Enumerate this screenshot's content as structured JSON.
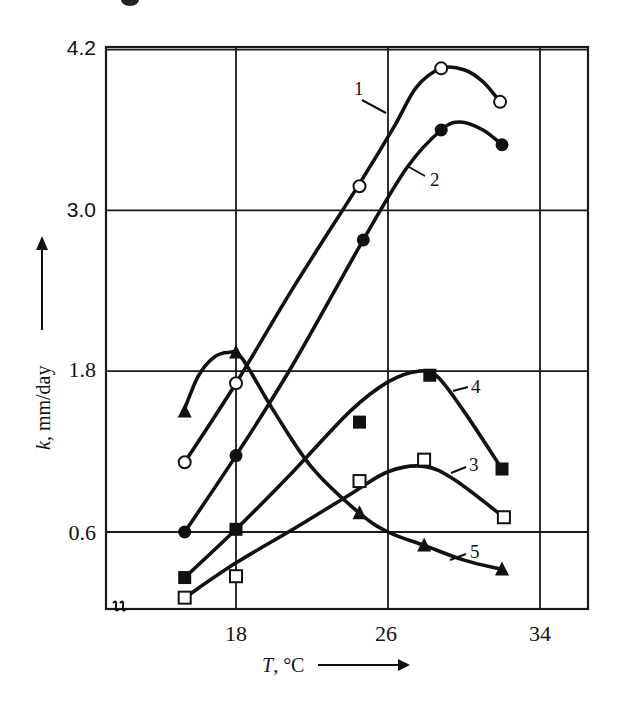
{
  "chart_data": {
    "type": "line",
    "title": "",
    "xlabel": "T, °C",
    "ylabel": "k, mm/day",
    "xlim": [
      11.2,
      36.5
    ],
    "ylim": [
      0.0,
      4.2
    ],
    "grid": true,
    "legend": "inline numeric labels 1-5 with leader lines",
    "x_ticks": [
      18,
      26,
      34
    ],
    "x_tick_labels": [
      "18",
      "26",
      "34"
    ],
    "y_ticks": [
      0.6,
      1.8,
      3.0,
      4.2
    ],
    "y_tick_labels": [
      "0.6",
      "1.8",
      "3.0",
      "4.2"
    ],
    "axis_break_mark": "ff",
    "series": [
      {
        "name": "1",
        "marker": "open-circle",
        "points": [
          {
            "x": 15.3,
            "y": 1.12
          },
          {
            "x": 18.0,
            "y": 1.71
          },
          {
            "x": 24.5,
            "y": 3.18
          },
          {
            "x": 28.8,
            "y": 4.06
          },
          {
            "x": 31.9,
            "y": 3.81
          }
        ],
        "curve": [
          [
            15.3,
            1.12
          ],
          [
            18.0,
            1.71
          ],
          [
            21.0,
            2.42
          ],
          [
            24.5,
            3.2
          ],
          [
            26.3,
            3.62
          ],
          [
            27.5,
            3.92
          ],
          [
            28.8,
            4.06
          ],
          [
            30.0,
            4.05
          ],
          [
            31.0,
            3.96
          ],
          [
            31.9,
            3.81
          ]
        ],
        "label_pos": [
          354,
          95
        ],
        "leader": [
          [
            362,
            100
          ],
          [
            386,
            113
          ]
        ]
      },
      {
        "name": "2",
        "marker": "filled-circle",
        "points": [
          {
            "x": 15.3,
            "y": 0.6
          },
          {
            "x": 18.0,
            "y": 1.17
          },
          {
            "x": 24.7,
            "y": 2.78
          },
          {
            "x": 28.8,
            "y": 3.6
          },
          {
            "x": 32.0,
            "y": 3.49
          }
        ],
        "curve": [
          [
            15.3,
            0.6
          ],
          [
            18.0,
            1.17
          ],
          [
            21.0,
            1.85
          ],
          [
            24.7,
            2.78
          ],
          [
            27.0,
            3.32
          ],
          [
            28.8,
            3.6
          ],
          [
            29.8,
            3.66
          ],
          [
            31.0,
            3.6
          ],
          [
            32.0,
            3.49
          ]
        ],
        "label_pos": [
          430,
          186
        ],
        "leader": [
          [
            409,
            167
          ],
          [
            425,
            176
          ]
        ]
      },
      {
        "name": "3",
        "marker": "open-square",
        "points": [
          {
            "x": 15.3,
            "y": 0.11
          },
          {
            "x": 18.0,
            "y": 0.27
          },
          {
            "x": 24.5,
            "y": 0.98
          },
          {
            "x": 27.9,
            "y": 1.14
          },
          {
            "x": 32.1,
            "y": 0.71
          }
        ],
        "curve": [
          [
            15.3,
            0.11
          ],
          [
            18.0,
            0.37
          ],
          [
            21.0,
            0.62
          ],
          [
            24.0,
            0.88
          ],
          [
            26.0,
            1.05
          ],
          [
            27.9,
            1.09
          ],
          [
            29.5,
            0.99
          ],
          [
            32.1,
            0.71
          ]
        ],
        "label_pos": [
          469,
          471
        ],
        "leader": [
          [
            451,
            473
          ],
          [
            466,
            467
          ]
        ]
      },
      {
        "name": "4",
        "marker": "filled-square",
        "points": [
          {
            "x": 15.3,
            "y": 0.26
          },
          {
            "x": 18.0,
            "y": 0.62
          },
          {
            "x": 24.5,
            "y": 1.42
          },
          {
            "x": 28.2,
            "y": 1.77
          },
          {
            "x": 32.0,
            "y": 1.07
          }
        ],
        "curve": [
          [
            15.3,
            0.26
          ],
          [
            18.0,
            0.62
          ],
          [
            21.0,
            1.05
          ],
          [
            24.0,
            1.5
          ],
          [
            26.0,
            1.72
          ],
          [
            27.6,
            1.8
          ],
          [
            28.6,
            1.76
          ],
          [
            30.0,
            1.5
          ],
          [
            32.0,
            1.07
          ]
        ],
        "label_pos": [
          471,
          393
        ],
        "leader": [
          [
            453,
            391
          ],
          [
            468,
            387
          ]
        ]
      },
      {
        "name": "5",
        "marker": "filled-triangle",
        "points": [
          {
            "x": 15.3,
            "y": 1.5
          },
          {
            "x": 18.0,
            "y": 1.94
          },
          {
            "x": 24.5,
            "y": 0.74
          },
          {
            "x": 27.9,
            "y": 0.5
          },
          {
            "x": 32.0,
            "y": 0.32
          }
        ],
        "curve": [
          [
            15.3,
            1.52
          ],
          [
            16.0,
            1.76
          ],
          [
            16.8,
            1.9
          ],
          [
            17.6,
            1.94
          ],
          [
            18.3,
            1.9
          ],
          [
            20.0,
            1.5
          ],
          [
            22.0,
            1.08
          ],
          [
            24.5,
            0.74
          ],
          [
            26.0,
            0.6
          ],
          [
            27.9,
            0.5
          ],
          [
            30.0,
            0.39
          ],
          [
            32.0,
            0.32
          ]
        ],
        "label_pos": [
          470,
          558
        ],
        "leader": [
          [
            450,
            560
          ],
          [
            466,
            554
          ]
        ]
      }
    ]
  },
  "axes": {
    "y_title": "k, mm/day",
    "y_title_italic_part": "k",
    "y_title_rest": ", mm/day",
    "x_title_italic_part": "T",
    "x_title_rest": ", °C",
    "y_tick_labels": [
      "4.2",
      "3.0",
      "1.8",
      "0.6"
    ],
    "x_tick_labels": [
      "18",
      "26",
      "34"
    ],
    "break_mark": "ff"
  },
  "colors": {
    "ink": "#111111",
    "background": "#ffffff"
  }
}
